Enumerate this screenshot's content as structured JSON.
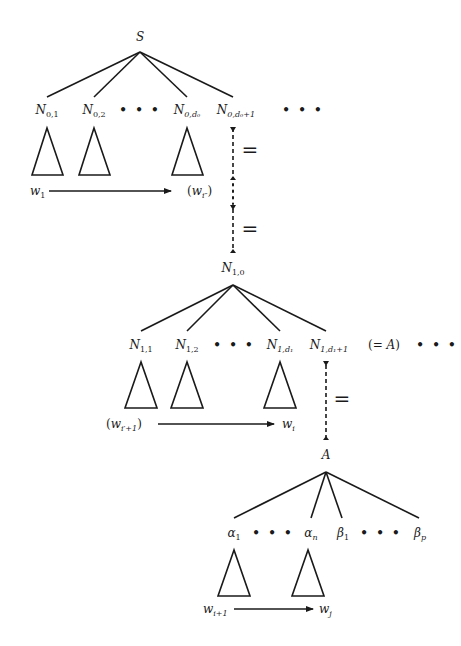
{
  "diagram": {
    "type": "parse-tree-decomposition",
    "level0": {
      "root": {
        "main": "S"
      },
      "children": [
        {
          "main": "N",
          "sub": "0,1"
        },
        {
          "main": "N",
          "sub": "0,2"
        },
        {
          "main": "…",
          "sub": ""
        },
        {
          "main": "N",
          "sub": "0,d₀"
        },
        {
          "main": "N",
          "sub": "0,d₀+1"
        },
        {
          "main": "…",
          "sub": ""
        }
      ],
      "yield_start": {
        "main": "w",
        "sub": "1"
      },
      "yield_end": {
        "open": "(",
        "main": "w",
        "sub": "i″",
        "close": ")"
      }
    },
    "equals_1": "=",
    "equals_2": "=",
    "level1": {
      "root": {
        "main": "N",
        "sub": "1,0"
      },
      "children": [
        {
          "main": "N",
          "sub": "1,1"
        },
        {
          "main": "N",
          "sub": "1,2"
        },
        {
          "main": "…",
          "sub": ""
        },
        {
          "main": "N",
          "sub": "1,d₁"
        },
        {
          "main": "N",
          "sub": "1,d₁+1"
        },
        {
          "main": "…",
          "sub": ""
        }
      ],
      "annotation": {
        "open": "(= ",
        "main": "A",
        "close": ")"
      },
      "yield_start": {
        "open": "(",
        "main": "w",
        "sub": "i′+1",
        "close": ")"
      },
      "yield_end": {
        "main": "w",
        "sub": "i"
      }
    },
    "equals_3": "=",
    "level2": {
      "root": {
        "main": "A"
      },
      "children": [
        {
          "main": "α",
          "sub": "1"
        },
        {
          "main": "…",
          "sub": ""
        },
        {
          "main": "α",
          "sub": "n"
        },
        {
          "main": "β",
          "sub": "1"
        },
        {
          "main": "…",
          "sub": ""
        },
        {
          "main": "β",
          "sub": "p"
        }
      ],
      "yield_start": {
        "main": "w",
        "sub": "i+1"
      },
      "yield_end": {
        "main": "w",
        "sub": "j"
      }
    },
    "ellipsis": "• • •"
  }
}
